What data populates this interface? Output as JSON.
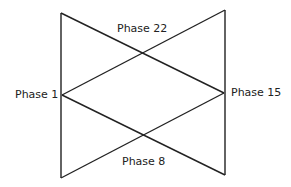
{
  "diagram": {
    "labels": {
      "top": "Phase 22",
      "left": "Phase 1",
      "right": "Phase 15",
      "bottom": "Phase 8"
    },
    "line_color": "#222222"
  }
}
